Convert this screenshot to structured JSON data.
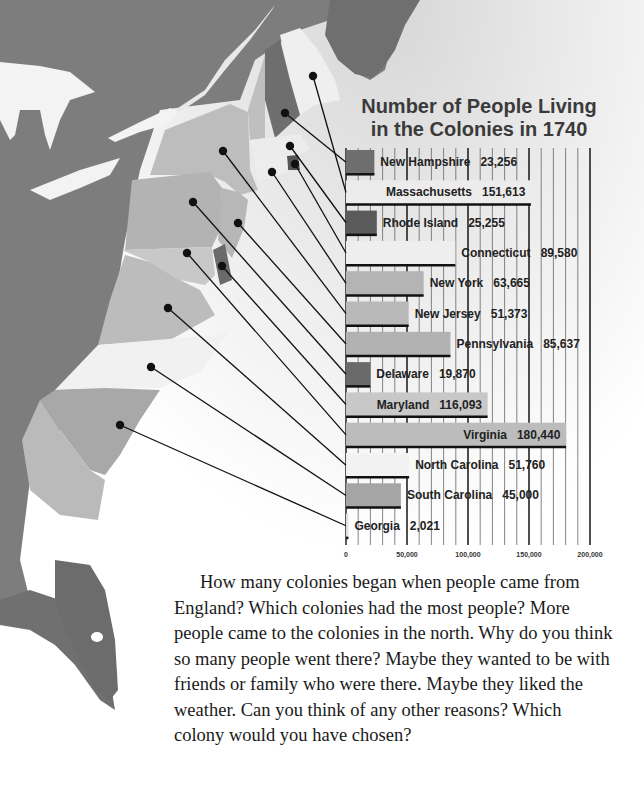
{
  "page": {
    "paragraph": "How many colonies began when people came from England? Which colonies had the most people? More people came to the colonies in the north. Why do you think so many people went there? Maybe they wanted to be with friends or family who were there. Maybe they liked the weather. Can you think of any other reasons? Which colony would you have chosen?"
  },
  "chart_data": {
    "type": "bar",
    "orientation": "horizontal",
    "title": "Number of People Living in the Colonies in 1740",
    "title_lines": [
      "Number of People Living",
      "in the Colonies in 1740"
    ],
    "xlabel": "",
    "ylabel": "",
    "xlim": [
      0,
      200000
    ],
    "x_ticks": [
      0,
      50000,
      100000,
      150000,
      200000
    ],
    "x_tick_labels": [
      "0",
      "50,000",
      "100,000",
      "150,000",
      "200,000"
    ],
    "grid": true,
    "legend": null,
    "categories": [
      "New Hampshire",
      "Massachusetts",
      "Rhode Island",
      "Connecticut",
      "New York",
      "New Jersey",
      "Pennsylvania",
      "Delaware",
      "Maryland",
      "Virginia",
      "North Carolina",
      "South Carolina",
      "Georgia"
    ],
    "values": [
      23256,
      151613,
      25255,
      89580,
      63665,
      51373,
      85637,
      19870,
      116093,
      180440,
      51760,
      45000,
      2021
    ],
    "value_labels": [
      "23,256",
      "151,613",
      "25,255",
      "89,580",
      "63,665",
      "51,373",
      "85,637",
      "19,870",
      "116,093",
      "180,440",
      "51,760",
      "45,000",
      "2,021"
    ],
    "bar_colors": [
      "#6e6e6e",
      "#ececec",
      "#5a5a5a",
      "#eeeeee",
      "#b4b4b4",
      "#b9b9b9",
      "#b2b2b2",
      "#6a6a6a",
      "#c8c8c8",
      "#bcbcbc",
      "#f2f2f2",
      "#a5a5a5",
      "#e0e0e0"
    ],
    "map_markers": [
      {
        "colony": "New Hampshire",
        "x": 285,
        "y": 113
      },
      {
        "colony": "Massachusetts",
        "x": 313,
        "y": 76
      },
      {
        "colony": "Rhode Island",
        "x": 290,
        "y": 146
      },
      {
        "colony": "Connecticut",
        "x": 295,
        "y": 164
      },
      {
        "colony": "New York",
        "x": 272,
        "y": 172
      },
      {
        "colony": "New Jersey",
        "x": 223,
        "y": 151
      },
      {
        "colony": "Pennsylvania",
        "x": 238,
        "y": 223
      },
      {
        "colony": "Delaware",
        "x": 193,
        "y": 202
      },
      {
        "colony": "Maryland",
        "x": 222,
        "y": 266
      },
      {
        "colony": "Virginia",
        "x": 187,
        "y": 253
      },
      {
        "colony": "North Carolina",
        "x": 168,
        "y": 308
      },
      {
        "colony": "South Carolina",
        "x": 151,
        "y": 367
      },
      {
        "colony": "Georgia",
        "x": 120,
        "y": 425
      }
    ]
  }
}
